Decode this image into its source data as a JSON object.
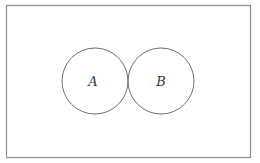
{
  "diagram": {
    "type": "venn",
    "universe": {
      "x": 6,
      "y": 5,
      "width": 244,
      "height": 152,
      "stroke": "#8a8a8a"
    },
    "sets": [
      {
        "label": "A",
        "cx": 95,
        "cy": 81,
        "r": 33,
        "stroke": "#6e6e6e"
      },
      {
        "label": "B",
        "cx": 161,
        "cy": 81,
        "r": 33,
        "stroke": "#6e6e6e"
      }
    ],
    "relationship": "disjoint (tangent circles)"
  }
}
